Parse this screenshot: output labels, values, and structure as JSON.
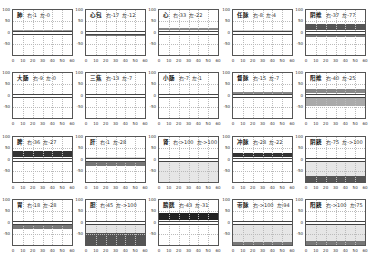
{
  "chart_data": {
    "type": "area",
    "title": "",
    "layout": {
      "rows": 4,
      "cols": 5
    },
    "xlim": [
      0,
      60
    ],
    "ylim": [
      -100,
      100
    ],
    "xticks": [
      "0",
      "10",
      "20",
      "30",
      "40",
      "50",
      "60"
    ],
    "yticks": [
      "100",
      "50",
      "0",
      "-50"
    ],
    "grid": true,
    "panels": [
      {
        "name": "肺",
        "right_label": "右-1",
        "left_label": "左-0",
        "right": -1,
        "left": 0,
        "upper_band": [
          0,
          10
        ],
        "lower_band": [
          -10,
          0
        ],
        "upper_shade": "#9a9a9a",
        "lower_shade": "#d8d8d8"
      },
      {
        "name": "心包",
        "right_label": "右-17",
        "left_label": "左-12",
        "right": -17,
        "left": -12,
        "upper_band": [
          0,
          10
        ],
        "lower_band": [
          -17,
          -5
        ],
        "upper_shade": "#ffffff",
        "lower_shade": "#777777"
      },
      {
        "name": "心",
        "right_label": "右-33",
        "left_label": "左-22",
        "right": -33,
        "left": -22,
        "upper_band": [
          10,
          22
        ],
        "lower_band": [
          -8,
          0
        ],
        "upper_shade": "#888888",
        "lower_shade": "#ffffff"
      },
      {
        "name": "任脉",
        "right_label": "右-8",
        "left_label": "左-4",
        "right": -8,
        "left": -4,
        "upper_band": [
          0,
          10
        ],
        "lower_band": [
          -8,
          0
        ],
        "upper_shade": "#cfcfcf",
        "lower_shade": "#ffffff"
      },
      {
        "name": "阴维",
        "right_label": "右-37",
        "left_label": "左-77",
        "right": -37,
        "left": -77,
        "upper_band": [
          10,
          37
        ],
        "lower_band": [
          -20,
          -8
        ],
        "upper_shade": "#555555",
        "lower_shade": "#777777"
      },
      {
        "name": "大肠",
        "right_label": "右-9",
        "left_label": "左-0",
        "right": -9,
        "left": 0,
        "upper_band": [
          0,
          10
        ],
        "lower_band": [
          -10,
          0
        ],
        "upper_shade": "#ffffff",
        "lower_shade": "#d0d0d0"
      },
      {
        "name": "三焦",
        "right_label": "右-13",
        "left_label": "左-7",
        "right": -13,
        "left": -7,
        "upper_band": [
          5,
          15
        ],
        "lower_band": [
          -8,
          0
        ],
        "upper_shade": "#ffffff",
        "lower_shade": "#ffffff"
      },
      {
        "name": "小肠",
        "right_label": "右-7",
        "left_label": "左-1",
        "right": -7,
        "left": -1,
        "upper_band": [
          0,
          10
        ],
        "lower_band": [
          -5,
          0
        ],
        "upper_shade": "#ffffff",
        "lower_shade": "#bbbbbb"
      },
      {
        "name": "督脉",
        "right_label": "右-15",
        "left_label": "左-7",
        "right": -15,
        "left": -7,
        "upper_band": [
          5,
          15
        ],
        "lower_band": [
          -8,
          0
        ],
        "upper_shade": "#888888",
        "lower_shade": "#cccccc"
      },
      {
        "name": "阳维",
        "right_label": "右-40",
        "left_label": "左-25",
        "right": -40,
        "left": -25,
        "upper_band": [
          10,
          30
        ],
        "lower_band": [
          -45,
          -8
        ],
        "upper_shade": "#888888",
        "lower_shade": "#aaaaaa"
      },
      {
        "name": "脾",
        "right_label": "右-36",
        "left_label": "左-27",
        "right": -36,
        "left": -27,
        "upper_band": [
          10,
          36
        ],
        "lower_band": [
          -8,
          0
        ],
        "upper_shade": "#333333",
        "lower_shade": "#ffffff"
      },
      {
        "name": "肝",
        "right_label": "右-1",
        "left_label": "左-28",
        "right": -1,
        "left": -28,
        "upper_band": [
          0,
          10
        ],
        "lower_band": [
          -28,
          -8
        ],
        "upper_shade": "#dddddd",
        "lower_shade": "#777777"
      },
      {
        "name": "肾",
        "right_label": "右->100",
        "left_label": "左->100",
        "right": -100,
        "left": -100,
        "upper_band": [
          0,
          10
        ],
        "lower_band": [
          -100,
          -8
        ],
        "upper_shade": "#ffffff",
        "lower_shade": "#e6e6e6"
      },
      {
        "name": "冲脉",
        "right_label": "右-28",
        "left_label": "左-22",
        "right": -28,
        "left": -22,
        "upper_band": [
          10,
          28
        ],
        "lower_band": [
          -8,
          0
        ],
        "upper_shade": "#333333",
        "lower_shade": "#ffffff"
      },
      {
        "name": "阴跷",
        "right_label": "右-75",
        "left_label": "左->100",
        "right": -75,
        "left": -100,
        "upper_band": [
          0,
          10
        ],
        "lower_band": [
          -100,
          -8
        ],
        "upper_shade": "#ffffff",
        "lower_shade": "#e6e6e6",
        "deep_band": [
          -100,
          -72
        ],
        "deep_shade": "#555555"
      },
      {
        "name": "胃",
        "right_label": "右-18",
        "left_label": "左-28",
        "right": -18,
        "left": -28,
        "upper_band": [
          5,
          18
        ],
        "lower_band": [
          -28,
          -8
        ],
        "upper_shade": "#ffffff",
        "lower_shade": "#777777"
      },
      {
        "name": "胆",
        "right_label": "右-45",
        "left_label": "左->100",
        "right": -45,
        "left": -100,
        "upper_band": [
          0,
          10
        ],
        "lower_band": [
          -100,
          -8
        ],
        "upper_shade": "#ffffff",
        "lower_shade": "#e6e6e6",
        "deep_band": [
          -100,
          -45
        ],
        "deep_shade": "#555555"
      },
      {
        "name": "膀胱",
        "right_label": "右-43",
        "left_label": "左-31",
        "right": -43,
        "left": -31,
        "upper_band": [
          10,
          43
        ],
        "lower_band": [
          -8,
          0
        ],
        "upper_shade": "#222222",
        "lower_shade": "#ffffff"
      },
      {
        "name": "带脉",
        "right_label": "右->100",
        "left_label": "左-94",
        "right": -100,
        "left": -94,
        "upper_band": [
          0,
          10
        ],
        "lower_band": [
          -100,
          -8
        ],
        "upper_shade": "#ffffff",
        "lower_shade": "#e6e6e6",
        "deep_band": [
          -100,
          -88
        ],
        "deep_shade": "#777777"
      },
      {
        "name": "阳跷",
        "right_label": "右->100",
        "left_label": "左-75",
        "right": -100,
        "left": -75,
        "upper_band": [
          0,
          10
        ],
        "lower_band": [
          -100,
          -8
        ],
        "upper_shade": "#ffffff",
        "lower_shade": "#e6e6e6",
        "deep_band": [
          -100,
          -80
        ],
        "deep_shade": "#777777"
      }
    ]
  }
}
